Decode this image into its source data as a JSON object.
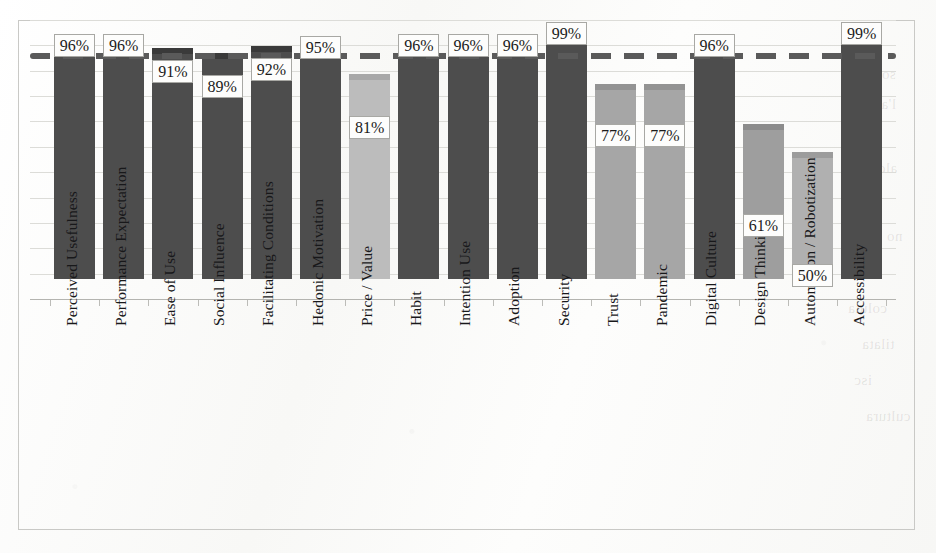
{
  "chart_data": {
    "type": "bar",
    "title": "",
    "subtitle": "",
    "xlabel": "",
    "ylabel": "",
    "ylim": [
      0,
      110
    ],
    "grid": true,
    "grid_interval": 10,
    "legend": "none",
    "value_suffix": "%",
    "categories": [
      "Perceived Usefulness",
      "Performance Expectation",
      "Ease of Use",
      "Social Influence",
      "Facilitating Conditions",
      "Hedonic Motivation",
      "Price / Value",
      "Habit",
      "Intention Use",
      "Adoption",
      "Security",
      "Trust",
      "Pandemic",
      "Digital Culture",
      "Design Thinking",
      "Automation / Robotization",
      "Accessibility"
    ],
    "values": [
      96,
      96,
      91,
      89,
      92,
      95,
      81,
      96,
      96,
      96,
      99,
      77,
      77,
      96,
      61,
      50,
      99
    ],
    "value_labels": [
      "96%",
      "96%",
      "91%",
      "89%",
      "92%",
      "95%",
      "81%",
      "96%",
      "96%",
      "96%",
      "99%",
      "77%",
      "77%",
      "96%",
      "61%",
      "50%",
      "99%"
    ],
    "bar_colors": [
      "#4d4d4d",
      "#4d4d4d",
      "#4d4d4d",
      "#4d4d4d",
      "#4d4d4d",
      "#4d4d4d",
      "#bcbcbc",
      "#4d4d4d",
      "#4d4d4d",
      "#4d4d4d",
      "#4d4d4d",
      "#a6a6a6",
      "#a6a6a6",
      "#4d4d4d",
      "#9e9e9e",
      "#b0b0b0",
      "#4d4d4d"
    ],
    "bar_cap_colors": [
      "#3a3a3a",
      "#3a3a3a",
      "#3a3a3a",
      "#3a3a3a",
      "#3a3a3a",
      "#3a3a3a",
      "#a8a8a8",
      "#3a3a3a",
      "#3a3a3a",
      "#3a3a3a",
      "#3a3a3a",
      "#939393",
      "#939393",
      "#3a3a3a",
      "#8c8c8c",
      "#9c9c9c",
      "#3a3a3a"
    ],
    "reference_line": {
      "style": "dashed",
      "value": 96,
      "color": "#5a5a5a",
      "label": ""
    }
  },
  "colors": {
    "bar_dark": "#4d4d4d",
    "bar_light": "#bcbcbc",
    "bar_medium": "#a6a6a6",
    "gridline": "#dcdcd8",
    "axis": "#b4b4b0",
    "frame": "#c9c9c6",
    "label_text": "#18181a",
    "paper": "#fbfbfa"
  },
  "bleed_through": [
    "sollut",
    "l'alt",
    "ndo",
    "aldet",
    "vsu",
    "no lo",
    "coluta",
    "tilata",
    "isc",
    "cultura"
  ]
}
